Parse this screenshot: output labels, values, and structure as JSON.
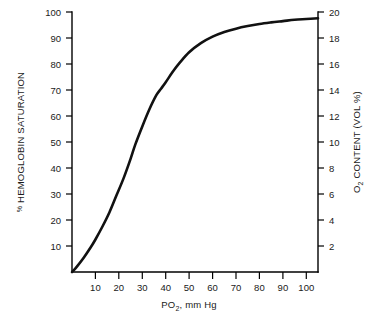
{
  "chart_data": {
    "type": "line",
    "title": "",
    "xlabel": "PO2, mm Hg",
    "xlabel_main": "PO",
    "xlabel_sub": "2",
    "xlabel_rest": ", mm Hg",
    "ylabel": "% HEMOGLOBIN SATURATION",
    "ylabel_percent": "%",
    "ylabel_rest": " HEMOGLOBIN SATURATION",
    "y2label": "O2 CONTENT (VOL %)",
    "y2label_main": "O",
    "y2label_sub": "2",
    "y2label_rest": " CONTENT (VOL %)",
    "grid": false,
    "legend": "none",
    "xlim": [
      0,
      105
    ],
    "ylim": [
      0,
      100
    ],
    "y2lim": [
      0,
      21
    ],
    "xticks": [
      10,
      20,
      30,
      40,
      50,
      60,
      70,
      80,
      90,
      100
    ],
    "yticks": [
      10,
      20,
      30,
      40,
      50,
      60,
      70,
      80,
      90,
      100
    ],
    "y2ticks": [
      2,
      4,
      6,
      8,
      10,
      12,
      14,
      16,
      18,
      20
    ],
    "series": [
      {
        "name": "oxyhemoglobin dissociation curve",
        "color": "#111111",
        "x": [
          0,
          2,
          5,
          8,
          10,
          13,
          16,
          19,
          22,
          25,
          27,
          30,
          33,
          36,
          38,
          40,
          43,
          46,
          50,
          55,
          60,
          65,
          70,
          75,
          80,
          85,
          90,
          95,
          100,
          105
        ],
        "values": [
          0,
          2,
          5.5,
          9.5,
          12.5,
          17.5,
          23,
          29.5,
          36,
          43.5,
          49,
          56,
          62.5,
          68,
          70.5,
          73,
          77,
          80.5,
          84.5,
          88,
          90.5,
          92.3,
          93.6,
          94.6,
          95.4,
          96,
          96.5,
          97,
          97.3,
          97.6
        ]
      }
    ],
    "annotations": [
      {
        "name": "p50",
        "label": "P50 ≈ 27 mm Hg at 50% saturation"
      }
    ]
  },
  "axes": {
    "left_tick_labels": [
      "100",
      "90",
      "80",
      "70",
      "60",
      "50",
      "40",
      "30",
      "20",
      "10"
    ],
    "right_tick_labels": [
      "20",
      "18",
      "16",
      "14",
      "12",
      "10",
      "8",
      "6",
      "4",
      "2"
    ],
    "bottom_tick_labels": [
      "10",
      "20",
      "30",
      "40",
      "50",
      "60",
      "70",
      "80",
      "90",
      "100"
    ]
  },
  "colors": {
    "curve": "#111111",
    "axis": "#000000",
    "text": "#1a1a1a",
    "background": "#ffffff"
  }
}
